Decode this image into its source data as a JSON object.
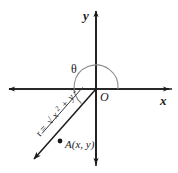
{
  "figure": {
    "background_color": "#ffffff",
    "line_color": "#1a1a1a",
    "arc_color": "#7a7a7a"
  },
  "axes": {
    "x_label": "x",
    "y_label": "y",
    "origin_label": "O"
  },
  "angle": {
    "symbol": "θ"
  },
  "point": {
    "label": "A(x, y)"
  },
  "radius": {
    "prefix": "r =",
    "radical": "√",
    "x_base": "x",
    "x_exp": "2",
    "plus": "+",
    "y_base": "y",
    "y_exp": "2",
    "full_text": "r = √(x² + y²)"
  }
}
